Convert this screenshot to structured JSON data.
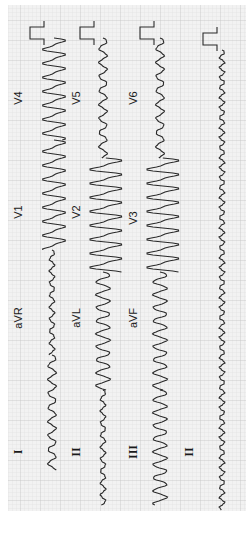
{
  "image": {
    "description": "12-lead ECG printout rotated 90 degrees clockwise on grid paper",
    "orientation": "rotated-90-cw",
    "colors": {
      "paper": "#f2f2f2",
      "grid_minor": "#dcdcdc",
      "grid_major": "#c4c4c4",
      "trace": "#2a2a2a",
      "margin": "#ffffff"
    }
  },
  "leads": {
    "columns": [
      {
        "x": 52,
        "segments": [
          {
            "label": "I",
            "style": "serif",
            "label_y": 452,
            "y0": 355,
            "y1": 470,
            "kind": "small"
          },
          {
            "label": "aVR",
            "style": "sans",
            "label_y": 318,
            "y0": 250,
            "y1": 355,
            "kind": "flat"
          },
          {
            "label": "V1",
            "style": "sans",
            "label_y": 212,
            "y0": 140,
            "y1": 250,
            "kind": "big"
          },
          {
            "label": "V4",
            "style": "sans",
            "label_y": 98,
            "y0": 38,
            "y1": 140,
            "kind": "big"
          }
        ]
      },
      {
        "x": 103,
        "segments": [
          {
            "label": "II",
            "style": "serif",
            "label_y": 452,
            "y0": 390,
            "y1": 505,
            "kind": "flat"
          },
          {
            "label": "aVL",
            "style": "sans",
            "label_y": 318,
            "y0": 272,
            "y1": 390,
            "kind": "medium"
          },
          {
            "label": "V2",
            "style": "sans",
            "label_y": 212,
            "y0": 158,
            "y1": 272,
            "kind": "huge"
          },
          {
            "label": "V5",
            "style": "sans",
            "label_y": 98,
            "y0": 38,
            "y1": 158,
            "kind": "small"
          }
        ]
      },
      {
        "x": 160,
        "segments": [
          {
            "label": "III",
            "style": "serif",
            "label_y": 452,
            "y0": 390,
            "y1": 505,
            "kind": "medium"
          },
          {
            "label": "aVF",
            "style": "sans",
            "label_y": 318,
            "y0": 272,
            "y1": 390,
            "kind": "medium"
          },
          {
            "label": "V3",
            "style": "sans",
            "label_y": 218,
            "y0": 158,
            "y1": 272,
            "kind": "huge"
          },
          {
            "label": "V6",
            "style": "sans",
            "label_y": 98,
            "y0": 38,
            "y1": 158,
            "kind": "small"
          }
        ]
      },
      {
        "x": 222,
        "segments": [
          {
            "label": "II",
            "style": "serif",
            "label_y": 452,
            "y0": 50,
            "y1": 510,
            "kind": "rhythm"
          }
        ]
      }
    ],
    "label_x": [
      22,
      80,
      137,
      193
    ]
  },
  "calibration_pulses": [
    {
      "x": 30,
      "y": 27
    },
    {
      "x": 80,
      "y": 27
    },
    {
      "x": 140,
      "y": 27
    },
    {
      "x": 203,
      "y": 33
    }
  ]
}
